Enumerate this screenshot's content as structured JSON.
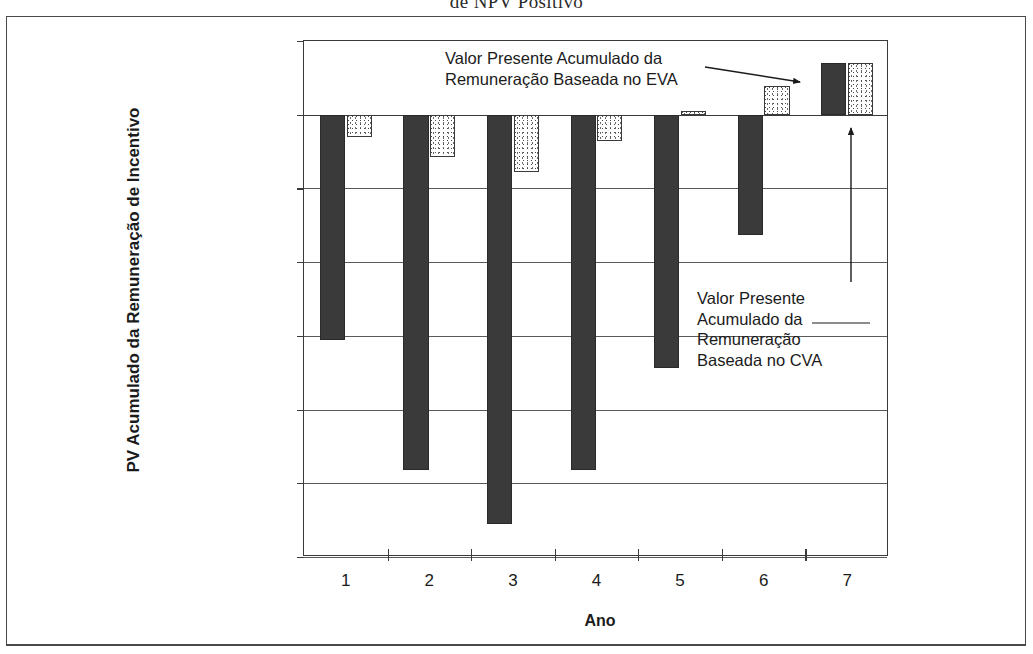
{
  "document": {
    "title_fragment": "de NPV Positivo"
  },
  "chart_data": {
    "type": "bar",
    "title": "de NPV Positivo",
    "xlabel": "Ano",
    "ylabel": "PV Acumulado da Remuneração de Incentivo",
    "categories": [
      "1",
      "2",
      "3",
      "4",
      "5",
      "6",
      "7"
    ],
    "ylim": [
      -12,
      2
    ],
    "ytick_labels": [
      "$2,00",
      "$0,00",
      "($2,00)",
      "($4,00)",
      "($6,00)",
      "($8,00)",
      "($10,00)",
      "($12,00)"
    ],
    "ytick_values": [
      2,
      0,
      -2,
      -4,
      -6,
      -8,
      -10,
      -12
    ],
    "grid": true,
    "legend_position": "none",
    "series": [
      {
        "name": "Valor Presente Acumulado da Remuneração Baseada no CVA",
        "key": "cva",
        "fill": "dark-solid",
        "color": "#3a3a3a",
        "values": [
          -6.1,
          -9.65,
          -11.1,
          -9.65,
          -6.88,
          -3.26,
          1.4
        ]
      },
      {
        "name": "Valor Presente Acumulado da Remuneração Baseada no EVA",
        "key": "eva",
        "fill": "light-stippled",
        "color": "#ffffff",
        "values": [
          -0.6,
          -1.15,
          -1.55,
          -0.72,
          0.1,
          0.78,
          1.4
        ]
      }
    ],
    "annotations": [
      {
        "id": "eva-callout",
        "text": "Valor Presente Acumulado da\nRemuneração Baseada no EVA",
        "points_to": "series-eva-bar-7"
      },
      {
        "id": "cva-callout",
        "text": "Valor Presente\nAcumulado da\nRemuneração\nBaseada no CVA",
        "points_to": "series-cva-bar-7"
      }
    ]
  }
}
